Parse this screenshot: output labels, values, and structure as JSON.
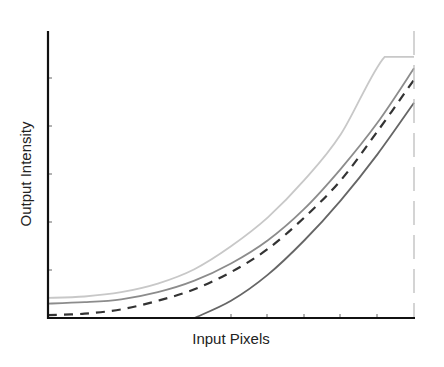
{
  "chart_data": {
    "type": "line",
    "title": "",
    "xlabel": "Input Pixels",
    "ylabel": "Output Intensity",
    "xlim": [
      0,
      1
    ],
    "ylim": [
      0,
      1
    ],
    "grid": false,
    "legend": null,
    "x_ticks_shown": true,
    "y_ticks_shown": true,
    "tick_labels_shown": false,
    "reference_lines": [
      {
        "type": "vertical",
        "x": 1.0,
        "style": "dashed",
        "color": "#b0b0b0"
      }
    ],
    "series": [
      {
        "name": "curve-1-lightest",
        "style": "solid",
        "color": "#c8c8c8",
        "x": [
          0,
          0.1,
          0.2,
          0.3,
          0.4,
          0.5,
          0.6,
          0.7,
          0.8,
          0.92,
          1.0
        ],
        "y": [
          0.07,
          0.075,
          0.09,
          0.12,
          0.17,
          0.25,
          0.35,
          0.48,
          0.64,
          0.91,
          0.91
        ]
      },
      {
        "name": "curve-2-medium",
        "style": "solid",
        "color": "#8c8c8c",
        "x": [
          0,
          0.1,
          0.2,
          0.3,
          0.4,
          0.5,
          0.6,
          0.7,
          0.8,
          0.9,
          1.0
        ],
        "y": [
          0.05,
          0.055,
          0.065,
          0.09,
          0.13,
          0.19,
          0.27,
          0.38,
          0.52,
          0.68,
          0.87
        ]
      },
      {
        "name": "curve-3-dashed",
        "style": "dashed",
        "color": "#333333",
        "x": [
          0,
          0.1,
          0.2,
          0.3,
          0.4,
          0.5,
          0.6,
          0.7,
          0.8,
          0.9,
          1.0
        ],
        "y": [
          0.01,
          0.015,
          0.03,
          0.06,
          0.1,
          0.16,
          0.24,
          0.35,
          0.48,
          0.65,
          0.83
        ]
      },
      {
        "name": "curve-4-dark",
        "style": "solid",
        "color": "#666666",
        "x": [
          0.4,
          0.5,
          0.6,
          0.7,
          0.8,
          0.9,
          1.0
        ],
        "y": [
          0.0,
          0.06,
          0.15,
          0.27,
          0.41,
          0.57,
          0.75
        ]
      }
    ]
  },
  "axes": {
    "x_label": "Input Pixels",
    "y_label": "Output Intensity"
  }
}
